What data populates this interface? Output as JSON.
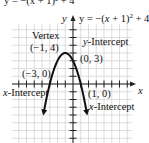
{
  "chart_data": {
    "type": "line",
    "title": "y = −(x + 1)² + 4",
    "equation_label": "y = −(x + 1)² + 4",
    "top_cut_text": "y = −(x + 1)² + 4",
    "xlabel": "x",
    "ylabel": "y",
    "xlim": [
      -7,
      8
    ],
    "ylim": [
      -7,
      9
    ],
    "grid": true,
    "series": [
      {
        "name": "y = -(x+1)^2 + 4",
        "x": [
          -4.6,
          -4,
          -3,
          -2,
          -1,
          0,
          1,
          2,
          2.6
        ],
        "y": [
          -8.96,
          -5,
          0,
          3,
          4,
          3,
          0,
          -5,
          -8.96
        ]
      }
    ],
    "annotations": [
      {
        "title": "Vertex",
        "point": "(−1, 4)",
        "x": -1,
        "y": 4
      },
      {
        "title": "y-Intercept",
        "point": "(0, 3)",
        "x": 0,
        "y": 3
      },
      {
        "title": "x-Intercept",
        "point": "(−3, 0)",
        "x": -3,
        "y": 0
      },
      {
        "title": "x-Intercept",
        "point": "(1, 0)",
        "x": 1,
        "y": 0
      }
    ]
  },
  "labels": {
    "vertex_title": "Vertex",
    "vertex_point": "(−1, 4)",
    "y_int_title_italic": "y",
    "y_int_title_rest": "-Intercept",
    "y_int_point": "(0, 3)",
    "x_int_left_point": "(−3, 0)",
    "x_int_left_italic": "x",
    "x_int_left_rest": "-Intercept",
    "x_int_right_point": "(1, 0)",
    "x_int_right_italic": "x",
    "x_int_right_rest": "-Intercept",
    "x_axis": "x",
    "y_axis": "y",
    "equation_y": "y = −(",
    "equation_x": "x",
    "equation_rest": " + 1)",
    "equation_sup": "2",
    "equation_tail": " + 4",
    "top_cut": "y = −(x + 1)² + 4"
  },
  "colors": {
    "grid": "#d4d4d4",
    "axis": "#222222",
    "curve": "#111111",
    "text": "#111111"
  }
}
